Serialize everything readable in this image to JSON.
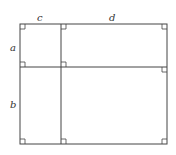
{
  "diagram": {
    "labels": {
      "c": "c",
      "d": "d",
      "a": "a",
      "b": "b"
    },
    "stroke_color": "#444444",
    "geometry": {
      "left": 20,
      "mid_x": 61,
      "right": 167,
      "top": 24,
      "mid_y": 67,
      "bottom": 144
    }
  }
}
